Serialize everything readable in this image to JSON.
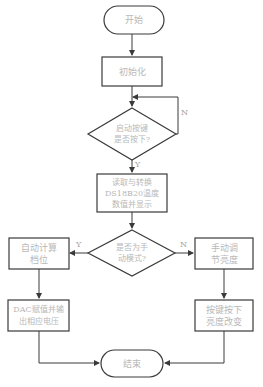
{
  "flowchart": {
    "start": "开始",
    "init": "初始化",
    "decision_key": "启动按键\n是否按下?",
    "read_temp": "读取与转换\nDS18B20温度\n数值并显示",
    "decision_mode": "是否为手\n动模式?",
    "auto_calc": "自动计算\n档位",
    "dac_output": "DAC赋值并输\n出相应电压",
    "manual_adjust": "手动调\n节亮度",
    "key_press": "按键按下\n亮度改变",
    "end": "结束",
    "labels": {
      "key_no": "N",
      "key_yes": "Y",
      "mode_yes": "Y",
      "mode_no": "N"
    }
  },
  "colors": {
    "stroke": "#3a3a3a",
    "text": "#b8b8b8"
  }
}
